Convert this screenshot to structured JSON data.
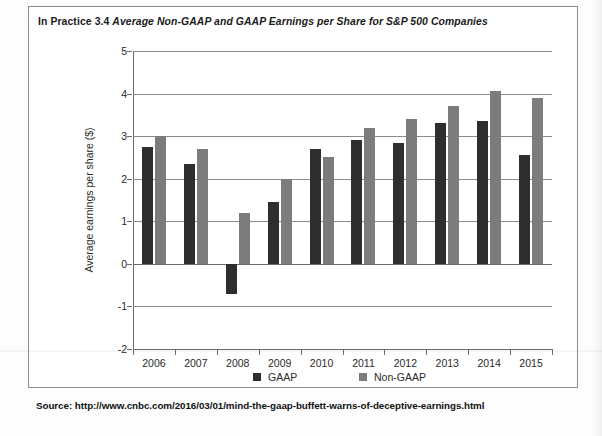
{
  "figure": {
    "caption_label": "In Practice 3.4",
    "caption_title": "Average Non-GAAP and GAAP Earnings per Share for S&P 500 Companies",
    "source": "Source: http://www.cnbc.com/2016/03/01/mind-the-gaap-buffett-warns-of-deceptive-earnings.html"
  },
  "colors": {
    "gaap": "#2e2e2e",
    "nongaap": "#7c7c7c",
    "axis": "#6b6b6b",
    "grid": "#8a8a8a",
    "border": "#8d8d8d"
  },
  "chart_data": {
    "type": "bar",
    "title": "Average Non-GAAP and GAAP Earnings per Share for S&P 500 Companies",
    "xlabel": "",
    "ylabel": "Average earnings per share ($)",
    "ylim": [
      -2,
      5
    ],
    "yticks": [
      5,
      4,
      3,
      2,
      1,
      0,
      -1,
      -2
    ],
    "ytick_labels": [
      "5",
      "4",
      "3",
      "2",
      "1",
      "0",
      "-1",
      "-2"
    ],
    "grid": true,
    "legend_position": "bottom",
    "categories": [
      "2006",
      "2007",
      "2008",
      "2009",
      "2010",
      "2011",
      "2012",
      "2013",
      "2014",
      "2015"
    ],
    "series": [
      {
        "name": "GAAP",
        "color": "#2e2e2e",
        "values": [
          2.75,
          2.35,
          -0.7,
          1.45,
          2.7,
          2.9,
          2.85,
          3.3,
          3.35,
          2.55
        ]
      },
      {
        "name": "Non-GAAP",
        "color": "#7c7c7c",
        "values": [
          3.0,
          2.7,
          1.2,
          2.0,
          2.5,
          3.2,
          3.4,
          3.7,
          4.05,
          3.9
        ]
      }
    ]
  }
}
